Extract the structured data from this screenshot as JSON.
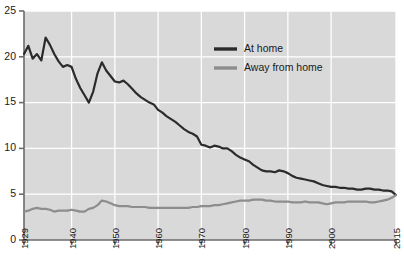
{
  "chart_data": {
    "type": "line",
    "title": "",
    "subtitle": "",
    "xlabel": "",
    "ylabel": "",
    "xlim": [
      1929,
      2015
    ],
    "ylim": [
      0,
      25
    ],
    "grid": true,
    "legend_position": "inside-top-right",
    "y_ticks": [
      0,
      5,
      10,
      15,
      20,
      25
    ],
    "y_tick_labels": [
      "0",
      "5",
      "10",
      "15",
      "20",
      "25"
    ],
    "x_ticks": [
      1929,
      1940,
      1950,
      1960,
      1970,
      1980,
      1990,
      2000,
      2015
    ],
    "x_tick_labels": [
      "1929",
      "1940",
      "1950",
      "1960",
      "1970",
      "1980",
      "1990",
      "2000",
      "2015"
    ],
    "colors": {
      "at_home": "#2b2b2b",
      "away_from_home": "#8d8d8d",
      "plot_background": "#d9d9d9",
      "gridline": "#ffffff",
      "axis": "#6b6b6b",
      "text": "#1a1a1a"
    },
    "x": [
      1929,
      1930,
      1931,
      1932,
      1933,
      1934,
      1935,
      1936,
      1937,
      1938,
      1939,
      1940,
      1941,
      1942,
      1943,
      1944,
      1945,
      1946,
      1947,
      1948,
      1949,
      1950,
      1951,
      1952,
      1953,
      1954,
      1955,
      1956,
      1957,
      1958,
      1959,
      1960,
      1961,
      1962,
      1963,
      1964,
      1965,
      1966,
      1967,
      1968,
      1969,
      1970,
      1971,
      1972,
      1973,
      1974,
      1975,
      1976,
      1977,
      1978,
      1979,
      1980,
      1981,
      1982,
      1983,
      1984,
      1985,
      1986,
      1987,
      1988,
      1989,
      1990,
      1991,
      1992,
      1993,
      1994,
      1995,
      1996,
      1997,
      1998,
      1999,
      2000,
      2001,
      2002,
      2003,
      2004,
      2005,
      2006,
      2007,
      2008,
      2009,
      2010,
      2011,
      2012,
      2013,
      2014,
      2015
    ],
    "series": [
      {
        "name": "At home",
        "color": "#2b2b2b",
        "values": [
          20.3,
          21.2,
          19.8,
          20.3,
          19.6,
          22.1,
          21.3,
          20.3,
          19.5,
          18.9,
          19.1,
          18.9,
          17.6,
          16.6,
          15.8,
          15.0,
          16.2,
          18.2,
          19.4,
          18.5,
          17.9,
          17.3,
          17.2,
          17.4,
          17.0,
          16.5,
          16.0,
          15.6,
          15.3,
          15.0,
          14.8,
          14.2,
          13.9,
          13.5,
          13.2,
          12.9,
          12.5,
          12.1,
          11.8,
          11.6,
          11.3,
          10.4,
          10.3,
          10.1,
          10.3,
          10.2,
          10.0,
          10.0,
          9.7,
          9.3,
          9.0,
          8.8,
          8.6,
          8.2,
          7.9,
          7.6,
          7.5,
          7.5,
          7.4,
          7.6,
          7.5,
          7.3,
          7.0,
          6.8,
          6.7,
          6.6,
          6.5,
          6.4,
          6.2,
          6.0,
          5.9,
          5.8,
          5.8,
          5.7,
          5.7,
          5.6,
          5.6,
          5.5,
          5.5,
          5.6,
          5.6,
          5.5,
          5.5,
          5.4,
          5.4,
          5.3,
          4.9
        ]
      },
      {
        "name": "Away from home",
        "color": "#8d8d8d",
        "values": [
          3.1,
          3.2,
          3.4,
          3.5,
          3.4,
          3.4,
          3.3,
          3.1,
          3.2,
          3.2,
          3.2,
          3.3,
          3.2,
          3.1,
          3.1,
          3.4,
          3.5,
          3.8,
          4.3,
          4.2,
          4.0,
          3.8,
          3.7,
          3.7,
          3.7,
          3.6,
          3.6,
          3.6,
          3.6,
          3.5,
          3.5,
          3.5,
          3.5,
          3.5,
          3.5,
          3.5,
          3.5,
          3.5,
          3.5,
          3.6,
          3.6,
          3.7,
          3.7,
          3.7,
          3.8,
          3.8,
          3.9,
          4.0,
          4.1,
          4.2,
          4.3,
          4.3,
          4.3,
          4.4,
          4.4,
          4.4,
          4.3,
          4.3,
          4.2,
          4.2,
          4.2,
          4.2,
          4.1,
          4.1,
          4.1,
          4.2,
          4.1,
          4.1,
          4.1,
          4.0,
          3.9,
          4.0,
          4.1,
          4.1,
          4.1,
          4.2,
          4.2,
          4.2,
          4.2,
          4.2,
          4.1,
          4.1,
          4.2,
          4.3,
          4.4,
          4.6,
          4.9
        ]
      }
    ]
  },
  "legend": {
    "items": [
      {
        "label": "At home",
        "color": "#2b2b2b"
      },
      {
        "label": "Away from home",
        "color": "#8d8d8d"
      }
    ]
  }
}
